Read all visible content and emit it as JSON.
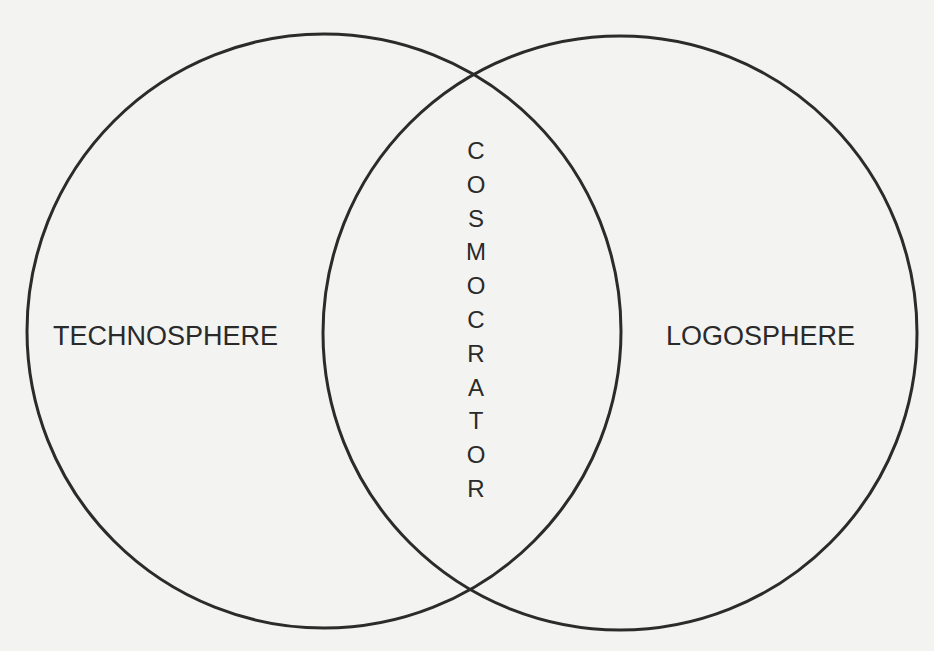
{
  "diagram": {
    "type": "venn",
    "stroke_color": "#2b2b2b",
    "background_color": "#f3f3f1",
    "circles": [
      {
        "name": "left-circle",
        "label": "TECHNOSPHERE"
      },
      {
        "name": "right-circle",
        "label": "LOGOSPHERE"
      }
    ],
    "intersection": {
      "label": "COSMOCRATOR",
      "letters": [
        "C",
        "O",
        "S",
        "M",
        "O",
        "C",
        "R",
        "A",
        "T",
        "O",
        "R"
      ]
    }
  }
}
